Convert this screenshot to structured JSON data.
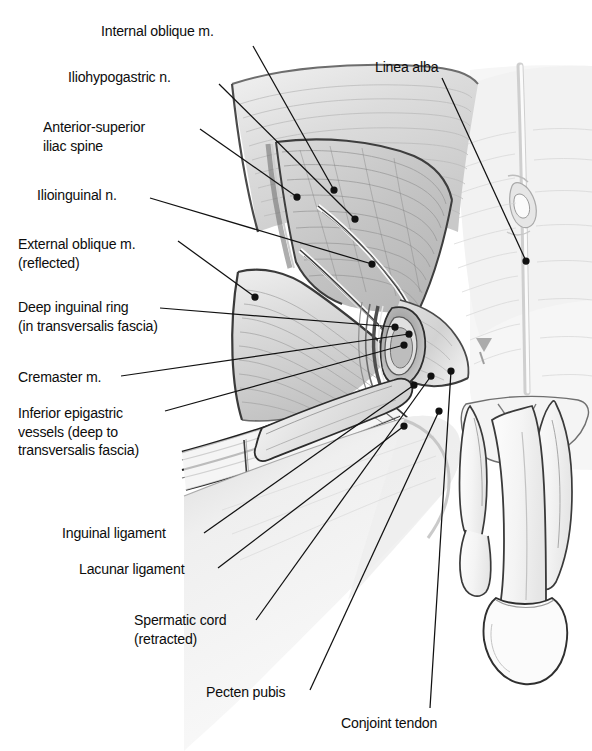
{
  "figure": {
    "background_color": "#ffffff",
    "ink_color": "#111111",
    "style": "grayscale medical line-and-tone illustration",
    "width": 592,
    "height": 751
  },
  "labels": [
    {
      "id": "internal-oblique",
      "lines": [
        "Internal oblique m."
      ],
      "text": "Internal oblique m.",
      "x": 101,
      "y": 22,
      "align": "left",
      "leader": {
        "from": [
          253,
          46
        ],
        "to": [
          334,
          190
        ],
        "dot": true
      }
    },
    {
      "id": "iliohypogastric-nerve",
      "lines": [
        "Iliohypogastric n."
      ],
      "text": "Iliohypogastric n.",
      "x": 68,
      "y": 68,
      "align": "left",
      "leader": {
        "from": [
          219,
          84
        ],
        "to": [
          355,
          219
        ],
        "dot": true
      }
    },
    {
      "id": "anterior-superior-iliac-spine",
      "lines": [
        "Anterior-superior",
        "iliac spine"
      ],
      "text": "Anterior-superior iliac spine",
      "x": 43,
      "y": 118,
      "align": "left",
      "leader": {
        "from": [
          200,
          129
        ],
        "to": [
          297,
          197
        ],
        "dot": true
      }
    },
    {
      "id": "ilioinguinal-nerve",
      "lines": [
        "Ilioinguinal n."
      ],
      "text": "Ilioinguinal n.",
      "x": 37,
      "y": 186,
      "align": "left",
      "leader": {
        "from": [
          150,
          198
        ],
        "to": [
          372,
          264
        ],
        "dot": true
      }
    },
    {
      "id": "external-oblique",
      "lines": [
        "External oblique m.",
        "(reflected)"
      ],
      "text": "External oblique m. (reflected)",
      "x": 18,
      "y": 235,
      "align": "left",
      "leader": {
        "from": [
          178,
          241
        ],
        "to": [
          255,
          297
        ],
        "dot": true
      }
    },
    {
      "id": "deep-inguinal-ring",
      "lines": [
        "Deep inguinal ring",
        "(in transversalis fascia)"
      ],
      "text": "Deep inguinal ring (in transversalis fascia)",
      "x": 18,
      "y": 298,
      "align": "left",
      "leader": {
        "from": [
          160,
          308
        ],
        "to": [
          395,
          327
        ],
        "dot": true
      }
    },
    {
      "id": "cremaster-muscle",
      "lines": [
        "Cremaster m."
      ],
      "text": "Cremaster m.",
      "x": 18,
      "y": 368,
      "align": "left",
      "leader": {
        "from": [
          121,
          376
        ],
        "to": [
          409,
          334
        ],
        "dot": true
      }
    },
    {
      "id": "inferior-epigastric-vessels",
      "lines": [
        "Inferior epigastric",
        "vessels (deep to",
        "transversalis fascia)"
      ],
      "text": "Inferior epigastric vessels (deep to transversalis fascia)",
      "x": 18,
      "y": 404,
      "align": "left",
      "leader": {
        "from": [
          165,
          411
        ],
        "to": [
          404,
          345
        ],
        "dot": true
      }
    },
    {
      "id": "inguinal-ligament",
      "lines": [
        "Inguinal ligament"
      ],
      "text": "Inguinal ligament",
      "x": 62,
      "y": 524,
      "align": "left",
      "leader": {
        "from": [
          204,
          533
        ],
        "to": [
          414,
          385
        ],
        "dot": true
      }
    },
    {
      "id": "lacunar-ligament",
      "lines": [
        "Lacunar ligament"
      ],
      "text": "Lacunar ligament",
      "x": 79,
      "y": 560,
      "align": "left",
      "leader": {
        "from": [
          218,
          568
        ],
        "to": [
          404,
          426
        ],
        "dot": true
      }
    },
    {
      "id": "spermatic-cord",
      "lines": [
        "Spermatic cord",
        "(retracted)"
      ],
      "text": "Spermatic cord (retracted)",
      "x": 134,
      "y": 611,
      "align": "left",
      "leader": {
        "from": [
          256,
          620
        ],
        "to": [
          431,
          376
        ],
        "dot": true
      }
    },
    {
      "id": "pecten-pubis",
      "lines": [
        "Pecten pubis"
      ],
      "text": "Pecten pubis",
      "x": 206,
      "y": 683,
      "align": "left",
      "leader": {
        "from": [
          310,
          690
        ],
        "to": [
          439,
          411
        ],
        "dot": true
      }
    },
    {
      "id": "conjoint-tendon",
      "lines": [
        "Conjoint tendon"
      ],
      "text": "Conjoint tendon",
      "x": 341,
      "y": 714,
      "align": "left",
      "leader": {
        "from": [
          430,
          708
        ],
        "to": [
          451,
          371
        ],
        "dot": true
      }
    },
    {
      "id": "linea-alba",
      "lines": [
        "Linea alba"
      ],
      "text": "Linea alba",
      "x": 375,
      "y": 58,
      "align": "left",
      "leader": {
        "from": [
          442,
          78
        ],
        "to": [
          526,
          261
        ],
        "dot": true
      }
    }
  ],
  "structures": [
    {
      "id": "abdominal-wall",
      "name": "anterior abdominal wall"
    },
    {
      "id": "internal-oblique-sheet",
      "name": "internal oblique muscle sheet"
    },
    {
      "id": "external-oblique-flap",
      "name": "reflected external oblique flap"
    },
    {
      "id": "rectus-sheath",
      "name": "rectus sheath / medial wall"
    },
    {
      "id": "inguinal-canal",
      "name": "inguinal canal and deep ring"
    },
    {
      "id": "inguinal-ligament-band",
      "name": "inguinal ligament"
    },
    {
      "id": "spermatic-cord-retracted",
      "name": "retracted spermatic cord"
    },
    {
      "id": "penis-scrotum",
      "name": "penis and scrotum"
    },
    {
      "id": "umbilicus",
      "name": "umbilicus"
    }
  ]
}
